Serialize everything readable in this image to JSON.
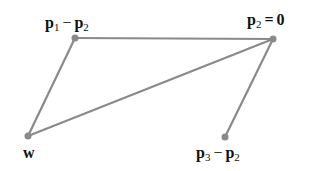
{
  "diagram": {
    "edge_color": "#8a8a8a",
    "point_color": "#8a8a8a",
    "points": [
      {
        "id": "p1mp2",
        "x": 75,
        "y": 38
      },
      {
        "id": "p2",
        "x": 273,
        "y": 39
      },
      {
        "id": "w",
        "x": 28,
        "y": 136
      },
      {
        "id": "p3mp2",
        "x": 225,
        "y": 137
      }
    ],
    "edges": [
      [
        "p1mp2",
        "p2"
      ],
      [
        "p1mp2",
        "w"
      ],
      [
        "w",
        "p2"
      ],
      [
        "p2",
        "p3mp2"
      ]
    ],
    "labels": {
      "p1mp2": {
        "a": "p",
        "a_sub": "1",
        "op": "−",
        "b": "p",
        "b_sub": "2"
      },
      "p2": {
        "a": "p",
        "a_sub": "2",
        "op": "=",
        "b": "0"
      },
      "w": {
        "a": "w"
      },
      "p3mp2": {
        "a": "p",
        "a_sub": "3",
        "op": "−",
        "b": "p",
        "b_sub": "2"
      }
    }
  }
}
